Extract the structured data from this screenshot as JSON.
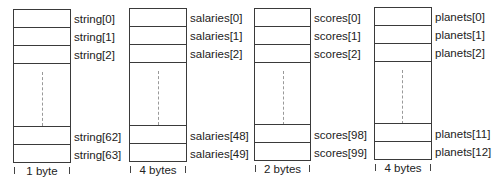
{
  "arrays": [
    {
      "name": "string",
      "element_size": "1 byte",
      "labels": [
        "string[0]",
        "string[1]",
        "string[2]",
        "string[62]",
        "string[63]"
      ]
    },
    {
      "name": "salaries",
      "element_size": "4 bytes",
      "labels": [
        "salaries[0]",
        "salaries[1]",
        "salaries[2]",
        "salaries[48]",
        "salaries[49]"
      ]
    },
    {
      "name": "scores",
      "element_size": "2 bytes",
      "labels": [
        "scores[0]",
        "scores[1]",
        "scores[2]",
        "scores[98]",
        "scores[99]"
      ]
    },
    {
      "name": "planets",
      "element_size": "4 bytes",
      "labels": [
        "planets[0]",
        "planets[1]",
        "planets[2]",
        "planets[11]",
        "planets[12]"
      ]
    }
  ],
  "colors": {
    "line": "#3a3a3a",
    "text": "#222222",
    "background": "#ffffff"
  }
}
